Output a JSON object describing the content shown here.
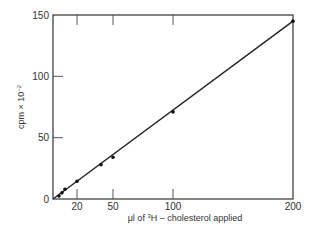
{
  "chart_data": {
    "type": "scatter",
    "title": "",
    "xlabel": "μl of ³H – cholesterol applied",
    "ylabel": "cpm × 10⁻²",
    "xlim": [
      0,
      200
    ],
    "ylim": [
      0,
      150
    ],
    "x_ticks": [
      20,
      50,
      100,
      200
    ],
    "x_tick_labels": [
      "20",
      "50",
      "100",
      "200"
    ],
    "y_ticks": [
      0,
      50,
      100,
      150
    ],
    "y_tick_labels": [
      "0",
      "50",
      "100",
      "150"
    ],
    "grid": false,
    "legend": null,
    "series": [
      {
        "name": "measured",
        "x": [
          5,
          7.5,
          10,
          20,
          40,
          50,
          100,
          200
        ],
        "y": [
          2.5,
          5,
          8,
          14.5,
          28,
          34,
          71,
          145
        ],
        "marker": "dot"
      },
      {
        "name": "fit line",
        "x": [
          0,
          200
        ],
        "y": [
          0,
          145
        ],
        "style": "line"
      }
    ]
  },
  "axes": {
    "x_label_prefix": "μl of ",
    "x_label_sup": "3",
    "x_label_suffix": "H – cholesterol applied",
    "y_label_main": "cpm × 10",
    "y_label_sup": "−2"
  }
}
